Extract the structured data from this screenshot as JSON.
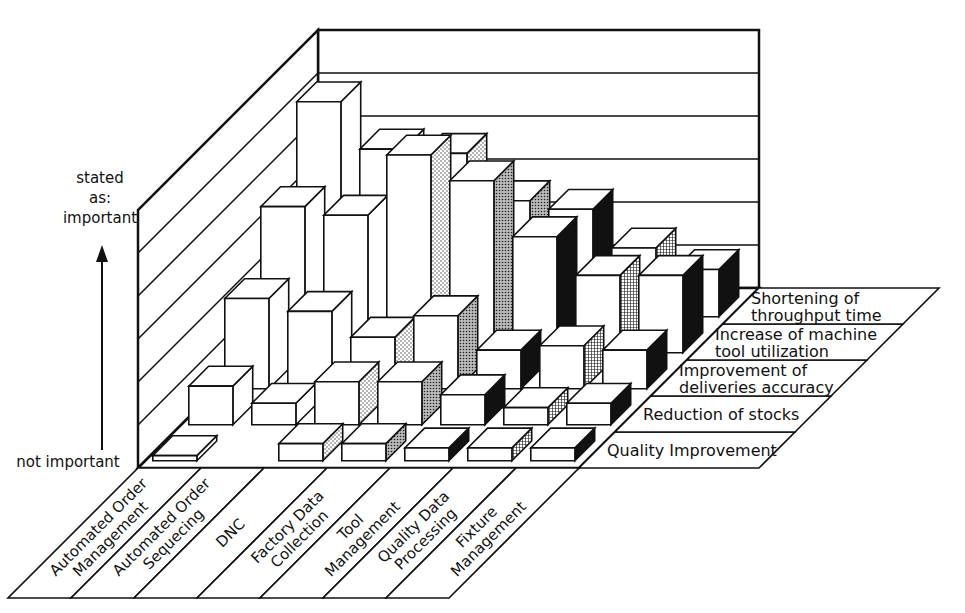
{
  "chart_data": {
    "type": "bar",
    "subtype": "3d-grouped-bar",
    "title": "",
    "ylabel_top": [
      "stated",
      "as:",
      "important"
    ],
    "ylabel_bottom": "not important",
    "y_scale": [
      0,
      6
    ],
    "grid": true,
    "categories": [
      "Automated Order Management",
      "Automated Order Sequecing",
      "DNC",
      "Factory Data Collection",
      "Tool Management",
      "Quality Data Processing",
      "Fixture Management"
    ],
    "category_label_lines": [
      [
        "Automated Order",
        "Management"
      ],
      [
        "Automated Order",
        "Sequecing"
      ],
      [
        "DNC"
      ],
      [
        "Factory Data",
        "Collection"
      ],
      [
        "Tool",
        "Management"
      ],
      [
        "Quality Data",
        "Processing"
      ],
      [
        "Fixture",
        "Management"
      ]
    ],
    "series": [
      {
        "name": "Quality Improvement",
        "label_lines": [
          "Quality Improvement"
        ],
        "values": [
          0.1,
          null,
          0.4,
          0.4,
          0.3,
          0.3,
          0.3
        ]
      },
      {
        "name": "Reduction of stocks",
        "label_lines": [
          "Reduction of stocks"
        ],
        "values": [
          0.9,
          0.5,
          1.0,
          1.0,
          0.7,
          0.4,
          0.5
        ]
      },
      {
        "name": "Improvement of deliveries accuracy",
        "label_lines": [
          "Improvement of",
          "deliveries accuracy"
        ],
        "values": [
          2.1,
          1.8,
          1.2,
          1.7,
          0.9,
          1.0,
          0.9
        ]
      },
      {
        "name": "Increase of machine tool utilization",
        "label_lines": [
          "Increase of machine",
          "tool utilization"
        ],
        "values": [
          3.4,
          3.2,
          4.6,
          4.0,
          2.7,
          1.8,
          1.8
        ]
      },
      {
        "name": "Shortening of throughput time",
        "label_lines": [
          "Shortening of",
          "throughput time"
        ],
        "values": [
          5.0,
          3.9,
          3.8,
          2.7,
          2.5,
          1.6,
          1.1
        ]
      }
    ],
    "side_patterns": [
      "plain",
      "plain",
      "dotted",
      "dark-dotted",
      "black",
      "crosshatch",
      "black"
    ]
  }
}
